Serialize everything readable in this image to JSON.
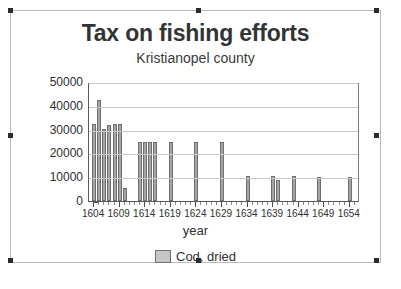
{
  "selection": {
    "handles": [
      "top-left",
      "top-center",
      "top-right",
      "middle-left",
      "middle-right",
      "bottom-left",
      "bottom-center",
      "bottom-right"
    ]
  },
  "chart_data": {
    "type": "bar",
    "title": "Tax on fishing efforts",
    "subtitle": "Kristianopel county",
    "xlabel": "year",
    "ylabel": "",
    "ylim": [
      0,
      50000
    ],
    "xlim": [
      1603,
      1656
    ],
    "grid": true,
    "legend_position": "bottom",
    "series": [
      {
        "name": "Cod, dried",
        "color": "#a6a6a6"
      }
    ],
    "yticks": [
      0,
      10000,
      20000,
      30000,
      40000,
      50000
    ],
    "ytick_labels": [
      "0",
      "10000",
      "20000",
      "30000",
      "40000",
      "50000"
    ],
    "xticks": [
      1604,
      1609,
      1614,
      1619,
      1624,
      1629,
      1634,
      1639,
      1644,
      1649,
      1654
    ],
    "xtick_labels": [
      "1604",
      "1609",
      "1614",
      "1619",
      "1624",
      "1629",
      "1634",
      "1639",
      "1644",
      "1649",
      "1654"
    ],
    "categories": [
      1604,
      1605,
      1606,
      1607,
      1608,
      1609,
      1610,
      1613,
      1614,
      1615,
      1616,
      1619,
      1624,
      1629,
      1634,
      1639,
      1640,
      1643,
      1648,
      1654
    ],
    "values": [
      32500,
      42500,
      30300,
      32100,
      32400,
      32400,
      5500,
      25000,
      25000,
      25000,
      25000,
      25000,
      25000,
      25000,
      10400,
      10400,
      8700,
      10400,
      10300,
      10300
    ]
  },
  "legend": {
    "entries": [
      {
        "label": "Cod, dried",
        "swatch": "legend-swatch-cod-dried"
      }
    ]
  }
}
